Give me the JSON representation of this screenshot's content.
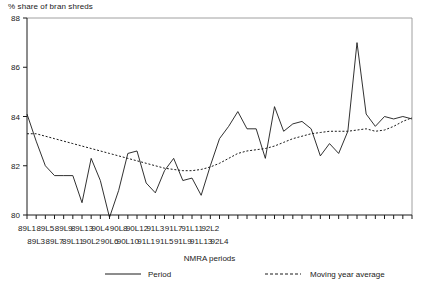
{
  "chart_data": {
    "type": "line",
    "title": "% share of bran shreds",
    "xlabel": "NMRA periods",
    "ylabel": "",
    "ylim": [
      80,
      88
    ],
    "yticks": [
      80,
      82,
      84,
      86,
      88
    ],
    "ytick_labels": [
      "80",
      "82",
      "84",
      "86",
      "88"
    ],
    "grid": false,
    "legend_position": "bottom",
    "categories": [
      "89L1",
      "89L2",
      "89L3",
      "89L4",
      "89L5",
      "89L6",
      "89L7",
      "89L8",
      "89L9",
      "89L10",
      "89L11",
      "89L12",
      "89L13",
      "90L1",
      "90L2",
      "90L3",
      "90L4",
      "90L5",
      "90L6",
      "90L7",
      "90L8",
      "90L9",
      "90L10",
      "90L11",
      "90L12",
      "90L13",
      "91L1",
      "91L2",
      "91L3",
      "91L4",
      "91L5",
      "91L6",
      "91L7",
      "91L8",
      "91L9",
      "91L10",
      "91L11",
      "91L12",
      "91L13",
      "92L1",
      "92L2",
      "92L3",
      "92L4"
    ],
    "xtick_labels_row1": [
      "89L1",
      "",
      "89L5",
      "",
      "89L9",
      "",
      "89L13",
      "",
      "90L4",
      "",
      "90L8",
      "",
      "90L12",
      "",
      "91L3",
      "",
      "91L7",
      "",
      "91L11",
      "",
      "92L2",
      "",
      ""
    ],
    "xtick_labels_row2": [
      "",
      "89L3",
      "",
      "89L7",
      "",
      "89L11",
      "",
      "90L2",
      "",
      "90L6",
      "",
      "90L10",
      "",
      "91L1",
      "",
      "91L5",
      "",
      "91L9",
      "",
      "91L13",
      "",
      "92L4"
    ],
    "series": [
      {
        "name": "Period",
        "style": "solid",
        "color": "#1a1a1a",
        "values": [
          84.1,
          83.0,
          82.0,
          81.6,
          81.6,
          81.6,
          80.5,
          82.3,
          81.4,
          79.9,
          81.0,
          82.5,
          82.6,
          81.3,
          80.9,
          81.8,
          82.3,
          81.4,
          81.5,
          80.8,
          82.0,
          83.1,
          83.6,
          84.2,
          83.5,
          83.5,
          82.3,
          84.4,
          83.4,
          83.7,
          83.8,
          83.5,
          82.4,
          82.9,
          82.5,
          83.4,
          87.0,
          84.1,
          83.6,
          84.0,
          83.9,
          84.0,
          83.9
        ]
      },
      {
        "name": "Moving year average",
        "style": "dotted",
        "color": "#1a1a1a",
        "values": [
          83.3,
          83.3,
          83.2,
          83.1,
          83.0,
          82.9,
          82.8,
          82.7,
          82.6,
          82.5,
          82.4,
          82.3,
          82.2,
          82.1,
          82.0,
          81.9,
          81.85,
          81.8,
          81.8,
          81.85,
          81.95,
          82.1,
          82.3,
          82.5,
          82.6,
          82.65,
          82.7,
          82.8,
          82.95,
          83.1,
          83.2,
          83.3,
          83.35,
          83.4,
          83.4,
          83.4,
          83.45,
          83.5,
          83.4,
          83.45,
          83.6,
          83.8,
          83.95
        ]
      }
    ],
    "legend": [
      {
        "label": "Period",
        "style": "solid"
      },
      {
        "label": "Moving year average",
        "style": "dotted"
      }
    ]
  },
  "layout": {
    "plot_left": 27,
    "plot_top": 18,
    "plot_right": 412,
    "plot_bottom": 215
  }
}
